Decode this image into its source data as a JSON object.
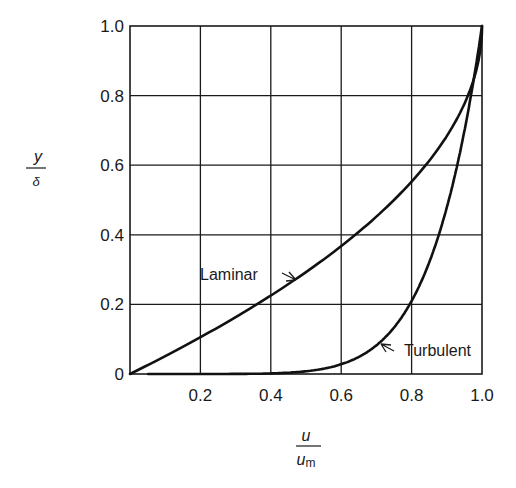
{
  "chart_data": {
    "type": "line",
    "title": "",
    "xlabel": "u / u_m",
    "ylabel": "y / δ",
    "xlabel_parts": {
      "num": "u",
      "den": "u",
      "den_sub": "m"
    },
    "ylabel_parts": {
      "num": "y",
      "den": "δ"
    },
    "xlim": [
      0,
      1.0
    ],
    "ylim": [
      0,
      1.0
    ],
    "grid": true,
    "x_ticks": [
      "0.2",
      "0.4",
      "0.6",
      "0.8",
      "1.0"
    ],
    "y_ticks": [
      "0",
      "0.2",
      "0.4",
      "0.6",
      "0.8",
      "1.0"
    ],
    "legend": "none (inline annotations)",
    "series": [
      {
        "name": "Laminar",
        "x": [
          0,
          0.19,
          0.36,
          0.51,
          0.64,
          0.75,
          0.84,
          0.91,
          0.96,
          0.99,
          1.0
        ],
        "y": [
          0,
          0.1,
          0.2,
          0.3,
          0.4,
          0.5,
          0.6,
          0.7,
          0.8,
          0.9,
          1.0
        ]
      },
      {
        "name": "Turbulent",
        "x": [
          0,
          0.2,
          0.4,
          0.57,
          0.63,
          0.72,
          0.79,
          0.84,
          0.88,
          0.93,
          0.97,
          1.0
        ],
        "y": [
          0,
          0.002,
          0.007,
          0.02,
          0.04,
          0.1,
          0.2,
          0.3,
          0.4,
          0.6,
          0.8,
          1.0
        ]
      }
    ],
    "annotations": [
      {
        "text": "Laminar",
        "x": 0.37,
        "y": 0.29,
        "points_to": "Laminar"
      },
      {
        "text": "Turbulent",
        "x": 0.81,
        "y": 0.07,
        "points_to": "Turbulent"
      }
    ]
  }
}
